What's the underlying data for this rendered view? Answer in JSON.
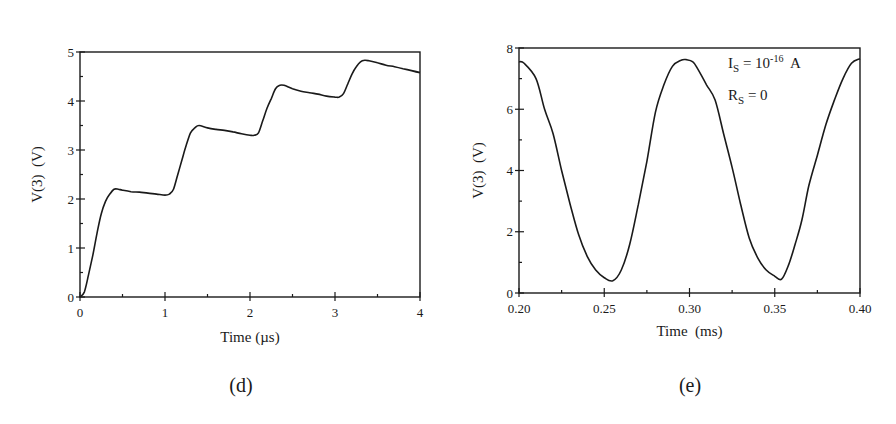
{
  "chart_data": [
    {
      "type": "line",
      "panel_label": "(d)",
      "title": "",
      "xlabel": "Time (µs)",
      "ylabel": "V(3)  (V)",
      "xlim": [
        0,
        4
      ],
      "ylim": [
        0,
        5
      ],
      "xticks": [
        "0",
        "1",
        "2",
        "3",
        "4"
      ],
      "yticks": [
        "0",
        "1",
        "2",
        "3",
        "4",
        "5"
      ],
      "grid": false,
      "legend": null,
      "series": [
        {
          "name": "V(3)",
          "x": [
            0,
            0.05,
            0.1,
            0.15,
            0.2,
            0.25,
            0.3,
            0.35,
            0.4,
            0.45,
            0.5,
            0.6,
            0.7,
            0.8,
            0.9,
            1.0,
            1.05,
            1.1,
            1.15,
            1.2,
            1.25,
            1.3,
            1.35,
            1.4,
            1.5,
            1.6,
            1.7,
            1.8,
            1.9,
            2.0,
            2.05,
            2.1,
            2.15,
            2.2,
            2.25,
            2.3,
            2.35,
            2.4,
            2.5,
            2.6,
            2.7,
            2.8,
            2.9,
            3.0,
            3.05,
            3.1,
            3.15,
            3.2,
            3.25,
            3.3,
            3.35,
            3.4,
            3.5,
            3.6,
            3.7,
            3.8,
            3.9,
            4.0
          ],
          "y": [
            0,
            0.1,
            0.45,
            0.85,
            1.3,
            1.7,
            1.95,
            2.1,
            2.2,
            2.2,
            2.18,
            2.15,
            2.14,
            2.12,
            2.1,
            2.08,
            2.1,
            2.2,
            2.5,
            2.8,
            3.1,
            3.35,
            3.45,
            3.5,
            3.45,
            3.42,
            3.4,
            3.37,
            3.33,
            3.3,
            3.3,
            3.35,
            3.6,
            3.85,
            4.05,
            4.25,
            4.32,
            4.32,
            4.25,
            4.2,
            4.17,
            4.14,
            4.1,
            4.08,
            4.08,
            4.15,
            4.35,
            4.55,
            4.7,
            4.8,
            4.83,
            4.82,
            4.78,
            4.73,
            4.7,
            4.66,
            4.62,
            4.58
          ]
        }
      ]
    },
    {
      "type": "line",
      "panel_label": "(e)",
      "title": "",
      "xlabel": "Time  (ms)",
      "ylabel": "V(3)  (V)",
      "xlim": [
        0.2,
        0.4
      ],
      "ylim": [
        0,
        8
      ],
      "xticks": [
        "0.20",
        "0.25",
        "0.30",
        "0.35",
        "0.40"
      ],
      "yticks": [
        "0",
        "2",
        "4",
        "6",
        "8"
      ],
      "grid": false,
      "legend": null,
      "annotations": [
        {
          "text": "I_S = 10^-16 A",
          "main": "I",
          "sub": "S",
          "eq": " = 10",
          "sup": "-16",
          "tail": "  A"
        },
        {
          "text": "R_S = 0",
          "main": "R",
          "sub": "S",
          "eq": " = 0"
        }
      ],
      "series": [
        {
          "name": "V(3)",
          "x": [
            0.2,
            0.203,
            0.21,
            0.215,
            0.22,
            0.225,
            0.23,
            0.235,
            0.24,
            0.245,
            0.25,
            0.255,
            0.26,
            0.265,
            0.27,
            0.275,
            0.28,
            0.285,
            0.29,
            0.295,
            0.298,
            0.302,
            0.305,
            0.31,
            0.315,
            0.32,
            0.325,
            0.33,
            0.335,
            0.34,
            0.345,
            0.35,
            0.354,
            0.358,
            0.362,
            0.366,
            0.37,
            0.375,
            0.38,
            0.385,
            0.39,
            0.395,
            0.4
          ],
          "y": [
            7.55,
            7.5,
            7.0,
            6.0,
            5.2,
            4.0,
            2.9,
            1.9,
            1.2,
            0.75,
            0.5,
            0.4,
            0.75,
            1.6,
            2.9,
            4.3,
            5.9,
            6.8,
            7.4,
            7.6,
            7.62,
            7.55,
            7.3,
            6.8,
            6.3,
            5.2,
            4.1,
            2.9,
            1.8,
            1.15,
            0.75,
            0.55,
            0.45,
            0.9,
            1.6,
            2.4,
            3.5,
            4.5,
            5.5,
            6.3,
            7.0,
            7.5,
            7.65
          ]
        }
      ]
    }
  ]
}
